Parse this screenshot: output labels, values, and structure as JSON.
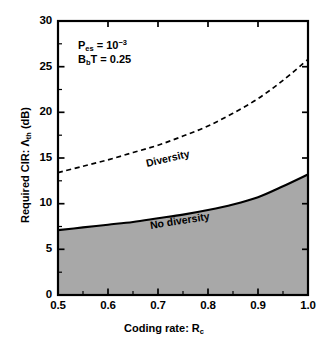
{
  "chart_data": {
    "type": "line",
    "title": "",
    "xlabel": "Coding rate:  R_c",
    "ylabel": "Required CIR:  Λ_th (dB)",
    "xlim": [
      0.5,
      1.0
    ],
    "ylim": [
      0,
      30
    ],
    "xticks": [
      "0.5",
      "0.6",
      "0.7",
      "0.8",
      "0.9",
      "1.0"
    ],
    "xtick_values": [
      0.5,
      0.6,
      0.7,
      0.8,
      0.9,
      1.0
    ],
    "yticks": [
      "0",
      "5",
      "10",
      "15",
      "20",
      "25",
      "30"
    ],
    "ytick_values": [
      0,
      5,
      10,
      15,
      20,
      25,
      30
    ],
    "grid": false,
    "legend": "inline-curve-labels",
    "x": [
      0.5,
      0.55,
      0.6,
      0.65,
      0.7,
      0.75,
      0.8,
      0.85,
      0.9,
      0.95,
      1.0
    ],
    "series": [
      {
        "name": "Diversity",
        "style": "dashed",
        "color": "#000000",
        "values": [
          13.4,
          14.1,
          14.8,
          15.6,
          16.4,
          17.4,
          18.5,
          19.9,
          21.5,
          23.5,
          25.8
        ]
      },
      {
        "name": "No diversity",
        "style": "solid",
        "color": "#000000",
        "fill": "#a8a8a8",
        "values": [
          7.1,
          7.4,
          7.7,
          8.0,
          8.4,
          8.8,
          9.3,
          9.9,
          10.7,
          11.9,
          13.2
        ]
      }
    ],
    "annotations": [
      {
        "id": "pes",
        "text": "P_es = 10^-3",
        "base": "P",
        "sub": "es",
        "eq": " = 10",
        "sup": "−3"
      },
      {
        "id": "bbt",
        "text": "B_b T = 0.25",
        "base": "B",
        "sub": "b",
        "eq": "T = 0.25"
      }
    ],
    "curve_labels": [
      {
        "id": "diversity",
        "text": "Diversity"
      },
      {
        "id": "no-diversity",
        "text": "No diversity"
      }
    ],
    "colors": {
      "axis": "#000000",
      "shaded_region": "#a8a8a8",
      "background": "#ffffff"
    }
  },
  "axes": {
    "y_label_main": "Required CIR:  ",
    "y_label_sym": "Λ",
    "y_label_sub": "th",
    "y_label_unit": " (dB)",
    "x_label_main": "Coding rate:  ",
    "x_label_sym": "R",
    "x_label_sub": "c"
  }
}
